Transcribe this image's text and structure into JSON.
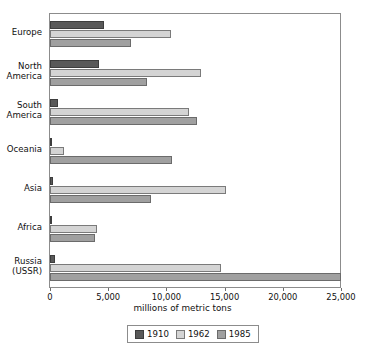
{
  "chart_data": {
    "type": "bar",
    "orientation": "horizontal",
    "title": "",
    "xlabel": "millions of metric tons",
    "ylabel": "",
    "xlim": [
      0,
      25000
    ],
    "xticks": [
      0,
      5000,
      10000,
      15000,
      20000,
      25000
    ],
    "xticklabels": [
      "0",
      "5,000",
      "10,000",
      "15,000",
      "20,000",
      "25,000"
    ],
    "grid": false,
    "legend_position": "bottom-center",
    "categories": [
      "Europe",
      "North\nAmerica",
      "South\nAmerica",
      "Oceania",
      "Asia",
      "Africa",
      "Russia\n(USSR)"
    ],
    "series": [
      {
        "name": "1910",
        "color": "#595959",
        "values": [
          4600,
          4200,
          700,
          100,
          250,
          100,
          400
        ]
      },
      {
        "name": "1962",
        "color": "#d4d4d4",
        "values": [
          10400,
          13000,
          11900,
          1200,
          15100,
          4000,
          14700
        ]
      },
      {
        "name": "1985",
        "color": "#a0a0a0",
        "values": [
          7000,
          8300,
          12600,
          10500,
          8700,
          3900,
          25000
        ]
      }
    ]
  },
  "legend": {
    "items": [
      {
        "label": "1910",
        "swatch": "s1910"
      },
      {
        "label": "1962",
        "swatch": "s1962"
      },
      {
        "label": "1985",
        "swatch": "s1985"
      }
    ]
  }
}
